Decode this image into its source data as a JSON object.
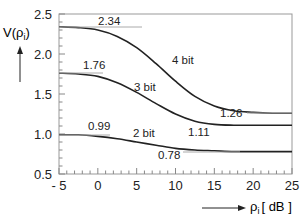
{
  "chart_data": {
    "type": "line",
    "title": "",
    "xlabel": "ρi [ dB ]",
    "ylabel": "V(ρi)",
    "xlim": [
      -5,
      25
    ],
    "ylim": [
      0.5,
      2.5
    ],
    "x_ticks": [
      "-5",
      "0",
      "5",
      "10",
      "15",
      "20",
      "25"
    ],
    "y_ticks": [
      "0.5",
      "1.0",
      "1.5",
      "2.0",
      "2.5"
    ],
    "grid": false,
    "legend": "inline labels",
    "x": [
      -5,
      -2.5,
      0,
      2.5,
      5,
      7.5,
      10,
      12.5,
      15,
      17.5,
      20,
      22.5,
      25
    ],
    "series": [
      {
        "name": "4 bit",
        "values": [
          2.34,
          2.33,
          2.3,
          2.22,
          2.08,
          1.88,
          1.66,
          1.47,
          1.35,
          1.29,
          1.27,
          1.26,
          1.26
        ],
        "low_asymptote": 1.26,
        "high_asymptote": 2.34
      },
      {
        "name": "3 bit",
        "values": [
          1.76,
          1.75,
          1.72,
          1.64,
          1.52,
          1.38,
          1.25,
          1.16,
          1.12,
          1.11,
          1.11,
          1.11,
          1.11
        ],
        "low_asymptote": 1.11,
        "high_asymptote": 1.76
      },
      {
        "name": "2 bit",
        "values": [
          0.99,
          0.99,
          0.97,
          0.94,
          0.9,
          0.86,
          0.82,
          0.8,
          0.79,
          0.78,
          0.78,
          0.78,
          0.78
        ],
        "low_asymptote": 0.78,
        "high_asymptote": 0.99
      }
    ],
    "annotations": [
      "2.34",
      "1.76",
      "0.99",
      "1.26",
      "1.11",
      "0.78",
      "4 bit",
      "3 bit",
      "2 bit"
    ]
  },
  "labels": {
    "ylabel_main": "V(ρ",
    "ylabel_sub": "i",
    "ylabel_close": ")",
    "xlabel_rho": "ρ",
    "xlabel_sub": "i",
    "xlabel_unit": "[ dB ]",
    "series_4": "4 bit",
    "series_3": "3 bit",
    "series_2": "2 bit",
    "v234": "2.34",
    "v176": "1.76",
    "v099": "0.99",
    "v126": "1.26",
    "v111": "1.11",
    "v078": "0.78"
  }
}
